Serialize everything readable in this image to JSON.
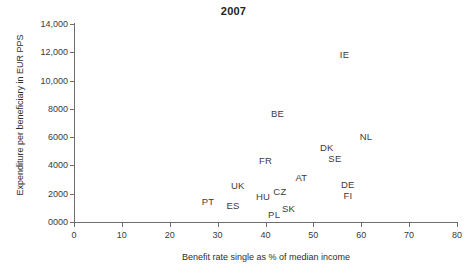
{
  "chart_data": {
    "type": "scatter",
    "title": "2007",
    "xlabel": "Benefit rate single as % of median income",
    "ylabel": "Expenditure per beneficiary in EUR PPS",
    "xlim": [
      0,
      80
    ],
    "ylim": [
      0,
      14000
    ],
    "xticks": [
      "0",
      "10",
      "20",
      "30",
      "40",
      "50",
      "60",
      "70",
      "80"
    ],
    "xtick_values": [
      0,
      10,
      20,
      30,
      40,
      50,
      60,
      70,
      80
    ],
    "yticks": [
      "0000",
      "2000",
      "4000",
      "6000",
      "8000",
      "10,000",
      "12,000",
      "14,000"
    ],
    "ytick_values": [
      0,
      2000,
      4000,
      6000,
      8000,
      10000,
      12000,
      14000
    ],
    "grid": false,
    "legend": "none",
    "point_style": "text-label-only",
    "points": [
      {
        "label": "IE",
        "x": 56.5,
        "y": 11900
      },
      {
        "label": "BE",
        "x": 42.5,
        "y": 7700
      },
      {
        "label": "NL",
        "x": 61.0,
        "y": 6100
      },
      {
        "label": "DK",
        "x": 52.8,
        "y": 5300
      },
      {
        "label": "SE",
        "x": 54.5,
        "y": 4500
      },
      {
        "label": "FR",
        "x": 40.0,
        "y": 4400
      },
      {
        "label": "AT",
        "x": 47.5,
        "y": 3200
      },
      {
        "label": "DE",
        "x": 57.2,
        "y": 2700
      },
      {
        "label": "UK",
        "x": 34.2,
        "y": 2600
      },
      {
        "label": "CZ",
        "x": 43.0,
        "y": 2200
      },
      {
        "label": "FI",
        "x": 57.2,
        "y": 1900
      },
      {
        "label": "HU",
        "x": 39.5,
        "y": 1850
      },
      {
        "label": "PT",
        "x": 28.0,
        "y": 1500
      },
      {
        "label": "ES",
        "x": 33.2,
        "y": 1200
      },
      {
        "label": "SK",
        "x": 44.8,
        "y": 1000
      },
      {
        "label": "PL",
        "x": 41.8,
        "y": 600
      }
    ]
  },
  "colors": {
    "axis": "#6e6e6e",
    "text": "#3b3b3b",
    "title": "#222222",
    "background": "#ffffff"
  }
}
